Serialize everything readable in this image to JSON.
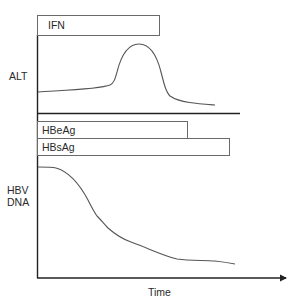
{
  "diagram": {
    "type": "clinical-timeline",
    "colors": {
      "line": "#555555",
      "axis": "#222222",
      "box_border": "#6a6a6a",
      "text": "#2a2a2a"
    },
    "bars": [
      {
        "id": "ifn",
        "label": "IFN"
      },
      {
        "id": "hbeag",
        "label": "HBeAg"
      },
      {
        "id": "hbsag",
        "label": "HBsAg"
      }
    ],
    "panels": {
      "alt": {
        "label": "ALT"
      },
      "hbv": {
        "label_line1": "HBV",
        "label_line2": "DNA"
      }
    },
    "x_axis": {
      "label": "Time",
      "arrow": true
    }
  }
}
